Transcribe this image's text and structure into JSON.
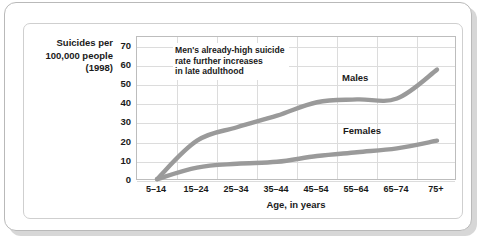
{
  "chart_data": {
    "type": "line",
    "title": "",
    "xlabel": "Age, in years",
    "ylabel": "Suicides per 100,000 people (1998)",
    "categories": [
      "5–14",
      "15–24",
      "25–34",
      "35–44",
      "45–54",
      "55–64",
      "65–74",
      "75+"
    ],
    "series": [
      {
        "name": "Males",
        "values": [
          1,
          21,
          28,
          34,
          41,
          42.5,
          43,
          58
        ],
        "color": "#9a9a9a"
      },
      {
        "name": "Females",
        "values": [
          1,
          7,
          9,
          10,
          13,
          15,
          17,
          21
        ],
        "color": "#9a9a9a"
      }
    ],
    "ylim": [
      0,
      75
    ],
    "yticks": [
      0,
      10,
      20,
      30,
      40,
      50,
      60,
      70
    ],
    "grid": true,
    "legend_position": "inline-on-plot",
    "annotations": [
      {
        "name": "males-trend-callout",
        "lines": [
          "Men's already-high suicide",
          "rate further increases",
          "in late adulthood"
        ]
      }
    ]
  },
  "axis": {
    "y_title_lines": [
      "Suicides per",
      "100,000 people",
      "(1998)"
    ],
    "y_tick_labels": [
      "70",
      "60",
      "50",
      "40",
      "30",
      "20",
      "10",
      "0"
    ],
    "x_tick_labels": [
      "5–14",
      "15–24",
      "25–34",
      "35–44",
      "45–54",
      "55–64",
      "65–74",
      "75+"
    ],
    "x_title": "Age, in years"
  },
  "series_labels": {
    "males": "Males",
    "females": "Females"
  },
  "annotation": {
    "line1": "Men's already-high suicide",
    "line2": "rate further increases",
    "line3": "in late adulthood"
  },
  "colors": {
    "line": "#9a9a9a",
    "grid": "#dcdcdc",
    "plot_border": "#bdbdbd",
    "frame_border": "#b9b9b9",
    "text": "#1a1a1a",
    "background": "#ffffff"
  }
}
